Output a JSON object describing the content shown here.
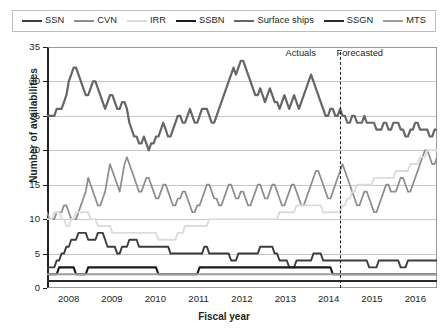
{
  "chart_data": {
    "type": "line",
    "title": "",
    "xlabel": "Fiscal year",
    "ylabel": "Number of availabilities",
    "ylim": [
      0,
      35
    ],
    "yticks": [
      0,
      5,
      10,
      15,
      20,
      25,
      30,
      35
    ],
    "xticks": [
      "2008",
      "2009",
      "2010",
      "2011",
      "2012",
      "2013",
      "2014",
      "2015",
      "2016"
    ],
    "xlim": [
      2007.6,
      2016.6
    ],
    "grid": true,
    "legend_position": "top",
    "annotations": [
      {
        "text": "Actuals",
        "x": 2014.0,
        "y": 34.2
      },
      {
        "text": "Forecasted",
        "x": 2014.6,
        "y": 34.2
      },
      {
        "text": "divider",
        "type": "vline",
        "x": 2014.35,
        "style": "dashed"
      }
    ],
    "series": [
      {
        "name": "SSN",
        "color": "#3c3c3c",
        "width": 1.9,
        "values": [
          3,
          3,
          3,
          3,
          4,
          4,
          5,
          5,
          6,
          6,
          7,
          7,
          7,
          8,
          8,
          8,
          8,
          7,
          7,
          7,
          7,
          8,
          8,
          8,
          7,
          6,
          6,
          6,
          6,
          5,
          5,
          6,
          6,
          6,
          7,
          7,
          7,
          7,
          6,
          6,
          6,
          6,
          6,
          6,
          6,
          6,
          6,
          6,
          6,
          6,
          6,
          5,
          5,
          5,
          5,
          5,
          5,
          5,
          5,
          5,
          5,
          5,
          5,
          5,
          5,
          6,
          6,
          5,
          5,
          5,
          5,
          5,
          5,
          5,
          5,
          5,
          4,
          4,
          4,
          5,
          5,
          5,
          5,
          5,
          5,
          5,
          5,
          5,
          6,
          6,
          6,
          6,
          6,
          6,
          5,
          5,
          4,
          4,
          4,
          4,
          3,
          3,
          3,
          4,
          4,
          4,
          4,
          4,
          4,
          4,
          5,
          5,
          5,
          5,
          4,
          4,
          4,
          4,
          4,
          4,
          4,
          4,
          4,
          4,
          4,
          4,
          4,
          4,
          4,
          4,
          4,
          4,
          4,
          3,
          3,
          3,
          3,
          4,
          4,
          4,
          4,
          4,
          4,
          4,
          4,
          4,
          3,
          3,
          3,
          4,
          4,
          4,
          4,
          4,
          4,
          4,
          4,
          4,
          4,
          4,
          4,
          4
        ]
      },
      {
        "name": "CVN",
        "color": "#8c8c8c",
        "width": 1.7,
        "values": [
          11,
          10,
          10,
          10,
          11,
          11,
          11,
          12,
          12,
          11,
          10,
          10,
          10,
          11,
          12,
          13,
          14,
          16,
          15,
          14,
          13,
          12,
          12,
          13,
          14,
          16,
          18,
          17,
          16,
          15,
          14,
          16,
          18,
          19,
          18,
          17,
          16,
          15,
          14,
          14,
          15,
          16,
          16,
          15,
          14,
          13,
          13,
          14,
          15,
          15,
          14,
          13,
          12,
          12,
          13,
          13,
          14,
          14,
          13,
          12,
          11,
          11,
          12,
          12,
          13,
          14,
          15,
          15,
          14,
          13,
          13,
          12,
          12,
          13,
          14,
          15,
          15,
          14,
          13,
          13,
          14,
          14,
          13,
          12,
          12,
          13,
          14,
          15,
          15,
          14,
          13,
          13,
          14,
          15,
          15,
          14,
          13,
          12,
          12,
          13,
          14,
          15,
          15,
          14,
          13,
          12,
          12,
          13,
          14,
          15,
          16,
          17,
          17,
          16,
          15,
          14,
          13,
          13,
          14,
          15,
          16,
          17,
          18,
          17,
          16,
          15,
          14,
          13,
          12,
          12,
          13,
          14,
          14,
          13,
          12,
          11,
          11,
          12,
          13,
          14,
          15,
          15,
          14,
          14,
          14,
          15,
          16,
          16,
          15,
          14,
          14,
          15,
          16,
          17,
          18,
          19,
          20,
          20,
          19,
          18,
          18,
          19
        ]
      },
      {
        "name": "IRR",
        "color": "#dcdcdc",
        "width": 1.9,
        "values": [
          10,
          10,
          10,
          11,
          11,
          11,
          10,
          10,
          9,
          9,
          10,
          10,
          11,
          11,
          11,
          11,
          11,
          11,
          10,
          10,
          10,
          9,
          9,
          9,
          9,
          9,
          9,
          8,
          8,
          8,
          8,
          8,
          8,
          8,
          8,
          8,
          8,
          8,
          8,
          8,
          8,
          8,
          8,
          8,
          8,
          8,
          7,
          7,
          7,
          7,
          7,
          7,
          7,
          7,
          8,
          8,
          8,
          9,
          9,
          9,
          9,
          9,
          9,
          9,
          9,
          9,
          9,
          10,
          10,
          10,
          10,
          10,
          10,
          10,
          10,
          10,
          10,
          10,
          10,
          10,
          10,
          10,
          10,
          10,
          10,
          10,
          10,
          10,
          10,
          10,
          10,
          10,
          10,
          10,
          10,
          10,
          11,
          11,
          11,
          11,
          11,
          11,
          11,
          12,
          12,
          12,
          12,
          12,
          12,
          12,
          12,
          12,
          12,
          12,
          11,
          11,
          11,
          11,
          11,
          11,
          11,
          11,
          12,
          12,
          13,
          13,
          14,
          14,
          15,
          15,
          15,
          15,
          15,
          15,
          15,
          16,
          16,
          16,
          16,
          16,
          16,
          16,
          16,
          16,
          17,
          17,
          17,
          17,
          17,
          17,
          18,
          18,
          18,
          18,
          19,
          19,
          19,
          20,
          20,
          20,
          20,
          20
        ]
      },
      {
        "name": "SSBN",
        "color": "#1a1a1a",
        "width": 2.1,
        "values": [
          2,
          2,
          2,
          2,
          2,
          3,
          3,
          3,
          3,
          3,
          3,
          3,
          2,
          2,
          2,
          2,
          2,
          3,
          3,
          3,
          3,
          3,
          3,
          3,
          3,
          3,
          3,
          3,
          3,
          3,
          3,
          3,
          3,
          3,
          3,
          3,
          3,
          3,
          3,
          3,
          3,
          3,
          3,
          3,
          3,
          3,
          2,
          2,
          2,
          2,
          2,
          2,
          2,
          2,
          2,
          2,
          2,
          2,
          2,
          2,
          2,
          2,
          2,
          3,
          3,
          3,
          3,
          3,
          3,
          3,
          3,
          3,
          3,
          3,
          3,
          3,
          3,
          3,
          3,
          3,
          3,
          3,
          3,
          3,
          3,
          3,
          3,
          3,
          3,
          3,
          3,
          3,
          3,
          3,
          3,
          3,
          3,
          3,
          3,
          3,
          3,
          3,
          3,
          3,
          3,
          3,
          3,
          3,
          3,
          3,
          3,
          3,
          3,
          3,
          3,
          3,
          3,
          3,
          2,
          2,
          2,
          2,
          2,
          2,
          2,
          2,
          2,
          2,
          2,
          2,
          2,
          2,
          2,
          2,
          2,
          2,
          2,
          2,
          2,
          2,
          2,
          2,
          2,
          2,
          2,
          2,
          2,
          2,
          2,
          2,
          2,
          2,
          2,
          2,
          2,
          2,
          2,
          2,
          2,
          2,
          2,
          2
        ]
      },
      {
        "name": "Surface ships",
        "color": "#666666",
        "width": 2.2,
        "values": [
          25,
          25,
          25,
          25,
          26,
          26,
          26,
          27,
          28,
          30,
          31,
          32,
          32,
          31,
          30,
          29,
          28,
          28,
          29,
          30,
          30,
          29,
          28,
          27,
          26,
          27,
          28,
          28,
          27,
          26,
          26,
          27,
          27,
          26,
          24,
          23,
          22,
          22,
          21,
          21,
          22,
          21,
          20,
          21,
          21,
          22,
          22,
          23,
          24,
          23,
          22,
          22,
          23,
          24,
          25,
          25,
          24,
          24,
          25,
          26,
          25,
          24,
          24,
          25,
          26,
          26,
          26,
          25,
          24,
          24,
          25,
          26,
          27,
          28,
          29,
          30,
          31,
          32,
          31,
          32,
          33,
          33,
          32,
          31,
          30,
          29,
          28,
          28,
          29,
          28,
          27,
          28,
          29,
          28,
          27,
          27,
          26,
          27,
          28,
          27,
          26,
          27,
          28,
          27,
          26,
          27,
          28,
          29,
          30,
          31,
          30,
          29,
          28,
          27,
          26,
          25,
          25,
          26,
          26,
          25,
          25,
          26,
          25,
          25,
          24,
          24,
          25,
          25,
          24,
          24,
          24,
          25,
          24,
          24,
          24,
          24,
          23,
          23,
          23,
          24,
          24,
          23,
          23,
          24,
          24,
          24,
          23,
          23,
          22,
          22,
          23,
          23,
          24,
          24,
          23,
          23,
          23,
          23,
          22,
          22,
          23,
          23
        ]
      },
      {
        "name": "SSGN",
        "color": "#2b2b2b",
        "width": 2.0,
        "values": [
          1,
          1,
          1,
          1,
          1,
          1,
          1,
          1,
          1,
          1,
          1,
          1,
          1,
          1,
          1,
          1,
          1,
          1,
          1,
          1,
          1,
          1,
          1,
          1,
          1,
          1,
          1,
          1,
          1,
          1,
          1,
          1,
          1,
          1,
          1,
          1,
          1,
          1,
          1,
          1,
          1,
          1,
          1,
          1,
          1,
          1,
          1,
          1,
          1,
          1,
          1,
          1,
          1,
          1,
          1,
          1,
          1,
          1,
          1,
          1,
          1,
          1,
          1,
          1,
          1,
          1,
          1,
          1,
          1,
          1,
          1,
          1,
          1,
          1,
          1,
          1,
          1,
          1,
          1,
          1,
          1,
          1,
          1,
          1,
          1,
          1,
          1,
          1,
          1,
          1,
          1,
          1,
          1,
          1,
          1,
          1,
          1,
          1,
          1,
          1,
          1,
          1,
          1,
          1,
          1,
          1,
          1,
          1,
          1,
          1,
          1,
          1,
          1,
          1,
          1,
          1,
          1,
          1,
          1,
          1,
          1,
          1,
          1,
          1,
          1,
          1,
          1,
          1,
          1,
          1,
          1,
          1,
          1,
          1,
          1,
          1,
          1,
          1,
          1,
          1,
          1,
          1,
          1,
          1,
          1,
          1,
          1,
          1,
          1,
          1,
          1,
          1,
          1,
          1,
          1,
          1,
          1,
          1,
          1,
          1,
          1,
          1
        ]
      },
      {
        "name": "MTS",
        "color": "#9d9d9d",
        "width": 1.8,
        "values": [
          2,
          2,
          2,
          2,
          2,
          2,
          2,
          2,
          2,
          2,
          2,
          2,
          2,
          2,
          2,
          2,
          2,
          2,
          2,
          2,
          2,
          2,
          2,
          2,
          2,
          2,
          2,
          2,
          2,
          2,
          2,
          2,
          2,
          2,
          2,
          2,
          2,
          2,
          2,
          2,
          2,
          2,
          2,
          2,
          2,
          2,
          2,
          2,
          2,
          2,
          2,
          2,
          2,
          2,
          2,
          2,
          2,
          2,
          2,
          2,
          2,
          2,
          2,
          2,
          2,
          2,
          2,
          2,
          2,
          2,
          2,
          2,
          2,
          2,
          2,
          2,
          2,
          2,
          2,
          2,
          2,
          2,
          2,
          2,
          2,
          2,
          2,
          2,
          2,
          2,
          2,
          2,
          2,
          2,
          2,
          2,
          2,
          2,
          2,
          2,
          2,
          2,
          2,
          2,
          2,
          2,
          2,
          2,
          2,
          2,
          2,
          2,
          2,
          2,
          2,
          2,
          2,
          2,
          2,
          2,
          2,
          2,
          2,
          2,
          2,
          2,
          2,
          2,
          2,
          2,
          2,
          2,
          2,
          2,
          2,
          2,
          2,
          2,
          2,
          2,
          2,
          2,
          2,
          2,
          2,
          2,
          2,
          2,
          2,
          2,
          2,
          2,
          2,
          2,
          2,
          2,
          2,
          2,
          2,
          2,
          2,
          2
        ]
      }
    ]
  },
  "legend": {
    "items": [
      {
        "label": "SSN",
        "color": "#3c3c3c",
        "width": 2.2
      },
      {
        "label": "CVN",
        "color": "#8c8c8c",
        "width": 2.0
      },
      {
        "label": "IRR",
        "color": "#dcdcdc",
        "width": 2.2
      },
      {
        "label": "SSBN",
        "color": "#1a1a1a",
        "width": 2.6
      },
      {
        "label": "Surface ships",
        "color": "#666666",
        "width": 2.4
      },
      {
        "label": "SSGN",
        "color": "#2b2b2b",
        "width": 2.6
      },
      {
        "label": "MTS",
        "color": "#9d9d9d",
        "width": 2.0
      }
    ]
  },
  "axes": {
    "y_label": "Number of availabilities",
    "x_label": "Fiscal year",
    "y_ticks": [
      "0",
      "5",
      "10",
      "15",
      "20",
      "25",
      "30",
      "35"
    ],
    "x_ticks": [
      "2008",
      "2009",
      "2010",
      "2011",
      "2012",
      "2013",
      "2014",
      "2015",
      "2016"
    ]
  },
  "annotations": {
    "actuals": "Actuals",
    "forecasted": "Forecasted"
  }
}
